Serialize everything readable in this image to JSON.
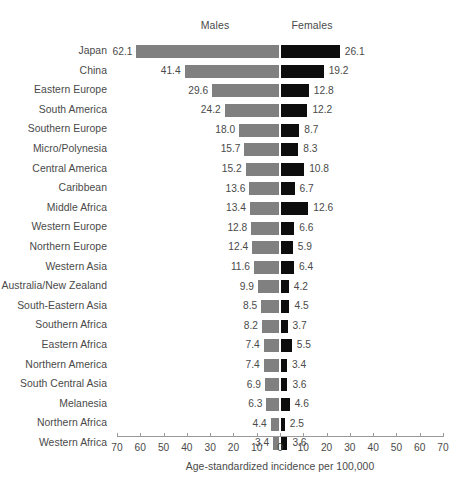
{
  "chart_data": {
    "type": "bar",
    "subtype": "diverging-horizontal-bar",
    "title": "",
    "xlabel": "Age-standardized incidence per 100,000",
    "ylabel": "",
    "xlim": [
      -70,
      70
    ],
    "grid": false,
    "legend_position": "top",
    "axis_ticks": [
      "70",
      "60",
      "50",
      "40",
      "30",
      "20",
      "10",
      "0",
      "10",
      "20",
      "30",
      "40",
      "50",
      "60",
      "70"
    ],
    "axis_tick_values": [
      -70,
      -60,
      -50,
      -40,
      -30,
      -20,
      -10,
      0,
      10,
      20,
      30,
      40,
      50,
      60,
      70
    ],
    "series": [
      {
        "name": "Males",
        "side": "left",
        "color": "#808080",
        "values": [
          62.1,
          41.4,
          29.6,
          24.2,
          18.0,
          15.7,
          15.2,
          13.6,
          13.4,
          12.8,
          12.4,
          11.6,
          9.9,
          8.5,
          8.2,
          7.4,
          7.4,
          6.9,
          6.3,
          4.4,
          3.4
        ]
      },
      {
        "name": "Females",
        "side": "right",
        "color": "#0d0d0d",
        "values": [
          26.1,
          19.2,
          12.8,
          12.2,
          8.7,
          8.3,
          10.8,
          6.7,
          12.6,
          6.6,
          5.9,
          6.4,
          4.2,
          4.5,
          3.7,
          5.5,
          3.4,
          3.6,
          4.6,
          2.5,
          3.6
        ]
      }
    ],
    "categories": [
      "Japan",
      "China",
      "Eastern Europe",
      "South America",
      "Southern Europe",
      "Micro/Polynesia",
      "Central America",
      "Caribbean",
      "Middle Africa",
      "Western Europe",
      "Northern Europe",
      "Western Asia",
      "Australia/New Zealand",
      "South-Eastern Asia",
      "Southern Africa",
      "Eastern Africa",
      "Northern America",
      "South Central Asia",
      "Melanesia",
      "Northern Africa",
      "Western Africa"
    ],
    "rows": [
      {
        "category": "Japan",
        "males": 62.1,
        "females": 26.1,
        "males_label": "62.1",
        "females_label": "26.1"
      },
      {
        "category": "China",
        "males": 41.4,
        "females": 19.2,
        "males_label": "41.4",
        "females_label": "19.2"
      },
      {
        "category": "Eastern Europe",
        "males": 29.6,
        "females": 12.8,
        "males_label": "29.6",
        "females_label": "12.8"
      },
      {
        "category": "South America",
        "males": 24.2,
        "females": 12.2,
        "males_label": "24.2",
        "females_label": "12.2"
      },
      {
        "category": "Southern Europe",
        "males": 18.0,
        "females": 8.7,
        "males_label": "18.0",
        "females_label": "8.7"
      },
      {
        "category": "Micro/Polynesia",
        "males": 15.7,
        "females": 8.3,
        "males_label": "15.7",
        "females_label": "8.3"
      },
      {
        "category": "Central America",
        "males": 15.2,
        "females": 10.8,
        "males_label": "15.2",
        "females_label": "10.8"
      },
      {
        "category": "Caribbean",
        "males": 13.6,
        "females": 6.7,
        "males_label": "13.6",
        "females_label": "6.7"
      },
      {
        "category": "Middle Africa",
        "males": 13.4,
        "females": 12.6,
        "males_label": "13.4",
        "females_label": "12.6"
      },
      {
        "category": "Western Europe",
        "males": 12.8,
        "females": 6.6,
        "males_label": "12.8",
        "females_label": "6.6"
      },
      {
        "category": "Northern Europe",
        "males": 12.4,
        "females": 5.9,
        "males_label": "12.4",
        "females_label": "5.9"
      },
      {
        "category": "Western Asia",
        "males": 11.6,
        "females": 6.4,
        "males_label": "11.6",
        "females_label": "6.4"
      },
      {
        "category": "Australia/New Zealand",
        "males": 9.9,
        "females": 4.2,
        "males_label": "9.9",
        "females_label": "4.2"
      },
      {
        "category": "South-Eastern Asia",
        "males": 8.5,
        "females": 4.5,
        "males_label": "8.5",
        "females_label": "4.5"
      },
      {
        "category": "Southern Africa",
        "males": 8.2,
        "females": 3.7,
        "males_label": "8.2",
        "females_label": "3.7"
      },
      {
        "category": "Eastern Africa",
        "males": 7.4,
        "females": 5.5,
        "males_label": "7.4",
        "females_label": "5.5"
      },
      {
        "category": "Northern America",
        "males": 7.4,
        "females": 3.4,
        "males_label": "7.4",
        "females_label": "3.4"
      },
      {
        "category": "South Central Asia",
        "males": 6.9,
        "females": 3.6,
        "males_label": "6.9",
        "females_label": "3.6"
      },
      {
        "category": "Melanesia",
        "males": 6.3,
        "females": 4.6,
        "males_label": "6.3",
        "females_label": "4.6"
      },
      {
        "category": "Northern Africa",
        "males": 4.4,
        "females": 2.5,
        "males_label": "4.4",
        "females_label": "2.5"
      },
      {
        "category": "Western Africa",
        "males": 3.4,
        "females": 3.6,
        "males_label": "3.4",
        "females_label": "3.6"
      }
    ]
  },
  "header": {
    "males_label": "Males",
    "females_label": "Females"
  },
  "axis": {
    "title": "Age-standardized incidence per 100,000"
  },
  "colors": {
    "males_bar": "#808080",
    "females_bar": "#0d0d0d",
    "axis_line": "#9a9a9a",
    "text": "#4a4a4a",
    "background": "#ffffff"
  }
}
